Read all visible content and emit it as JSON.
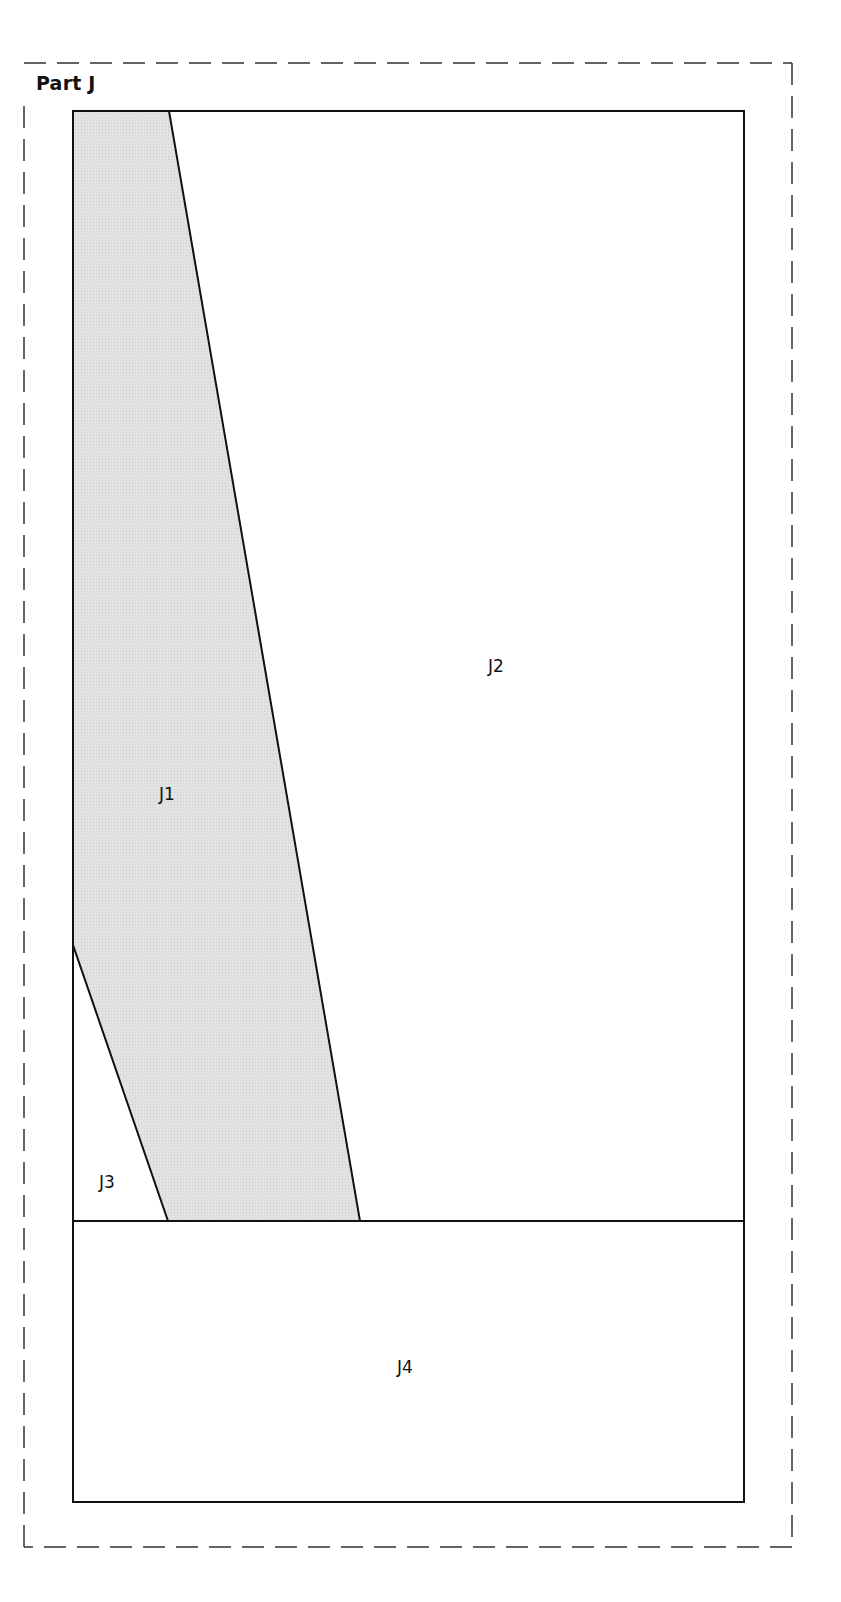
{
  "title": "Part J",
  "colors": {
    "shaded_fill": "#dcdcdc",
    "line": "#111111",
    "background": "#ffffff"
  },
  "pieces": [
    {
      "id": "J1",
      "label": "J1",
      "shaded": true
    },
    {
      "id": "J2",
      "label": "J2",
      "shaded": false
    },
    {
      "id": "J3",
      "label": "J3",
      "shaded": false
    },
    {
      "id": "J4",
      "label": "J4",
      "shaded": false
    }
  ]
}
